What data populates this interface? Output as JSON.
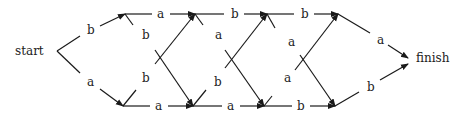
{
  "diagram": {
    "start_label": "start",
    "finish_label": "finish",
    "edges": [
      {
        "id": "start-top",
        "label": "b"
      },
      {
        "id": "start-bottom",
        "label": "a"
      },
      {
        "id": "top-1-2",
        "label": "a"
      },
      {
        "id": "top-2-3",
        "label": "b"
      },
      {
        "id": "top-3-4",
        "label": "b"
      },
      {
        "id": "bot-1-2",
        "label": "a"
      },
      {
        "id": "bot-2-3",
        "label": "a"
      },
      {
        "id": "bot-3-4",
        "label": "b"
      },
      {
        "id": "cross-1-down",
        "label": "b"
      },
      {
        "id": "cross-1-up",
        "label": "b"
      },
      {
        "id": "cross-2-down",
        "label": "a"
      },
      {
        "id": "cross-2-up",
        "label": "b"
      },
      {
        "id": "cross-3-down",
        "label": "a"
      },
      {
        "id": "cross-3-up",
        "label": "a"
      },
      {
        "id": "top-finish",
        "label": "a"
      },
      {
        "id": "bottom-finish",
        "label": "b"
      }
    ]
  }
}
